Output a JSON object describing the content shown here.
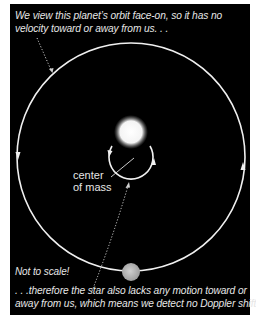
{
  "figure": {
    "top_caption": {
      "line1": "We view this planet’s orbit face-on, so it has no",
      "line2": "velocity toward or away from us. . ."
    },
    "center_of_mass_label": {
      "line1": "center",
      "line2": "of mass"
    },
    "note": "Not to scale!",
    "bottom_caption": {
      "line1": ". . .therefore the star also lacks any motion toward or",
      "line2": "away from us, which means we detect no Doppler shift."
    },
    "colors": {
      "background": "#000000",
      "frame": "#ffffff",
      "text": "#e6e6e6",
      "orbit_line": "#f0f0f0",
      "planet": "#b8b8b8",
      "star": "#ffffff"
    },
    "elements": {
      "star": {
        "cx": 131,
        "cy": 132,
        "r": 15
      },
      "star_orbit": {
        "cx": 131,
        "cy": 158,
        "r": 22,
        "direction": "counterclockwise"
      },
      "planet_orbit": {
        "cx": 131,
        "cy": 157,
        "r": 114,
        "direction": "counterclockwise"
      },
      "planet": {
        "cx": 131,
        "cy": 272,
        "r": 9
      }
    }
  }
}
